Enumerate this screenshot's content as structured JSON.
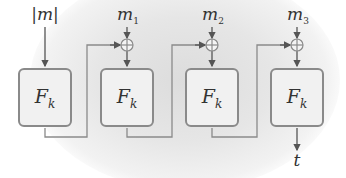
{
  "diagram": {
    "input_label": "|m|",
    "blocks": [
      {
        "func": "F",
        "key": "k",
        "message": null
      },
      {
        "func": "F",
        "key": "k",
        "message": "m",
        "message_index": "1"
      },
      {
        "func": "F",
        "key": "k",
        "message": "m",
        "message_index": "2"
      },
      {
        "func": "F",
        "key": "k",
        "message": "m",
        "message_index": "3"
      }
    ],
    "xor_symbol": "⊕",
    "output_label": "t",
    "colors": {
      "stroke": "#8a8a8a",
      "box_fill": "#f1f1f1",
      "text": "#333333",
      "background_glow": "#dcdcdc"
    }
  }
}
